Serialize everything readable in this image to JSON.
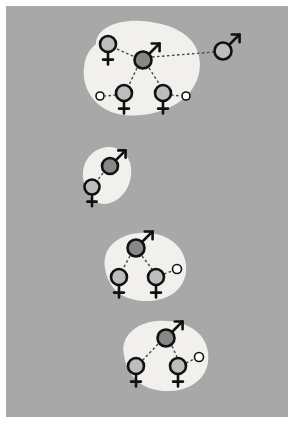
{
  "figure": {
    "canvas": {
      "width": 294,
      "height": 423,
      "margin": 6,
      "background_color": "#a8a8a8",
      "page_color": "#ffffff"
    },
    "legend_colors": {
      "group_blob_fill": "#f2f0ec",
      "dominant_fill": "#878787",
      "subordinate_fill": "#bdbdbd",
      "juvenile_fill": "#ffffff",
      "outline": "#111111",
      "link_line": "#4a4a4a"
    }
  },
  "groups": [
    {
      "id": "group-1",
      "name": "group-top",
      "label": "Group 1",
      "blob": {
        "path": "M 96 44 C 96 28, 118 19, 142 21 C 168 23, 190 32, 197 50 C 205 70, 196 92, 176 104 C 154 117, 124 119, 107 110 C 90 101, 82 84, 84 68 C 85 56, 89 50, 96 44 Z"
      },
      "members": [
        {
          "id": "g1-f1",
          "symbol": "female",
          "label": "Female 1",
          "fill": "subordinate",
          "cx": 108,
          "cy": 44,
          "r": 8
        },
        {
          "id": "g1-m1",
          "symbol": "male",
          "label": "Male 1 (dominant)",
          "fill": "dominant",
          "cx": 143,
          "cy": 60,
          "r": 8.5
        },
        {
          "id": "g1-f2",
          "symbol": "female",
          "label": "Female 2",
          "fill": "subordinate",
          "cx": 124,
          "cy": 93,
          "r": 8
        },
        {
          "id": "g1-f3",
          "symbol": "female",
          "label": "Female 3",
          "fill": "subordinate",
          "cx": 163,
          "cy": 93,
          "r": 8
        },
        {
          "id": "g1-j1",
          "symbol": "juvenile",
          "label": "Juvenile 1",
          "fill": "juvenile",
          "cx": 100,
          "cy": 96,
          "r": 4
        },
        {
          "id": "g1-j2",
          "symbol": "juvenile",
          "label": "Juvenile 2",
          "fill": "juvenile",
          "cx": 186,
          "cy": 96,
          "r": 4
        }
      ],
      "links": [
        {
          "from": "g1-f1",
          "to": "g1-m1",
          "x1": 117,
          "y1": 49,
          "x2": 135,
          "y2": 57
        },
        {
          "from": "g1-m1",
          "to": "g1-f2",
          "x1": 137,
          "y1": 68,
          "x2": 129,
          "y2": 85
        },
        {
          "from": "g1-m1",
          "to": "g1-f3",
          "x1": 149,
          "y1": 68,
          "x2": 160,
          "y2": 85
        },
        {
          "from": "g1-f2",
          "to": "g1-j1",
          "x1": 116,
          "y1": 95,
          "x2": 105,
          "y2": 96
        },
        {
          "from": "g1-f3",
          "to": "g1-j2",
          "x1": 171,
          "y1": 95,
          "x2": 181,
          "y2": 96
        }
      ]
    },
    {
      "id": "group-2",
      "name": "group-second",
      "label": "Group 2",
      "blob": {
        "path": "M 84 182 C 80 167, 88 152, 102 148 C 116 144, 129 152, 131 167 C 133 183, 124 199, 110 203 C 96 207, 87 197, 84 182 Z"
      },
      "members": [
        {
          "id": "g2-m1",
          "symbol": "male",
          "label": "Male 1 (dominant)",
          "fill": "dominant",
          "cx": 110,
          "cy": 166,
          "r": 8
        },
        {
          "id": "g2-f1",
          "symbol": "female",
          "label": "Female 1",
          "fill": "subordinate",
          "cx": 92,
          "cy": 187,
          "r": 7.5
        }
      ],
      "links": [
        {
          "from": "g2-m1",
          "to": "g2-f1",
          "x1": 103,
          "y1": 173,
          "x2": 97,
          "y2": 181
        }
      ]
    },
    {
      "id": "group-3",
      "name": "group-third",
      "label": "Group 3",
      "blob": {
        "path": "M 105 268 C 102 249, 116 235, 139 233 C 164 231, 184 244, 186 265 C 188 286, 172 300, 149 301 C 125 302, 108 290, 105 268 Z"
      },
      "members": [
        {
          "id": "g3-m1",
          "symbol": "male",
          "label": "Male 1 (dominant)",
          "fill": "dominant",
          "cx": 136,
          "cy": 248,
          "r": 8.5
        },
        {
          "id": "g3-f1",
          "symbol": "female",
          "label": "Female 1",
          "fill": "subordinate",
          "cx": 119,
          "cy": 277,
          "r": 8
        },
        {
          "id": "g3-f2",
          "symbol": "female",
          "label": "Female 2",
          "fill": "subordinate",
          "cx": 156,
          "cy": 277,
          "r": 8
        },
        {
          "id": "g3-j1",
          "symbol": "juvenile",
          "label": "Juvenile 1",
          "fill": "juvenile",
          "cx": 177,
          "cy": 269,
          "r": 4.5
        }
      ],
      "links": [
        {
          "from": "g3-m1",
          "to": "g3-f1",
          "x1": 130,
          "y1": 256,
          "x2": 123,
          "y2": 269
        },
        {
          "from": "g3-m1",
          "to": "g3-f2",
          "x1": 142,
          "y1": 256,
          "x2": 152,
          "y2": 269
        },
        {
          "from": "g3-f2",
          "to": "g3-j1",
          "x1": 164,
          "y1": 274,
          "x2": 172,
          "y2": 271
        }
      ]
    },
    {
      "id": "group-4",
      "name": "group-bottom",
      "label": "Group 4",
      "blob": {
        "path": "M 124 355 C 120 338, 134 323, 157 321 C 184 319, 205 331, 208 352 C 211 374, 195 390, 170 391 C 143 392, 127 377, 124 355 Z"
      },
      "members": [
        {
          "id": "g4-m1",
          "symbol": "male",
          "label": "Male 1 (dominant)",
          "fill": "dominant",
          "cx": 166,
          "cy": 338,
          "r": 8.5
        },
        {
          "id": "g4-f1",
          "symbol": "female",
          "label": "Female 1",
          "fill": "subordinate",
          "cx": 136,
          "cy": 366,
          "r": 8
        },
        {
          "id": "g4-f2",
          "symbol": "female",
          "label": "Female 2",
          "fill": "subordinate",
          "cx": 178,
          "cy": 366,
          "r": 8
        },
        {
          "id": "g4-j1",
          "symbol": "juvenile",
          "label": "Juvenile 1",
          "fill": "juvenile",
          "cx": 199,
          "cy": 357,
          "r": 4.5
        }
      ],
      "links": [
        {
          "from": "g4-m1",
          "to": "g4-f1",
          "x1": 158,
          "y1": 344,
          "x2": 143,
          "y2": 360
        },
        {
          "from": "g4-m1",
          "to": "g4-f2",
          "x1": 172,
          "y1": 346,
          "x2": 177,
          "y2": 357
        },
        {
          "from": "g4-f2",
          "to": "g4-j1",
          "x1": 186,
          "y1": 363,
          "x2": 194,
          "y2": 359
        }
      ]
    }
  ],
  "dispersers": [
    {
      "id": "disperser-1",
      "name": "dispersing-male",
      "label": "Dispersing male",
      "symbol": "male",
      "fill": "subordinate",
      "cx": 223,
      "cy": 51,
      "r": 8.5,
      "link": {
        "from": "g1-m1",
        "x1": 152,
        "y1": 57,
        "x2": 214,
        "y2": 52
      }
    }
  ]
}
